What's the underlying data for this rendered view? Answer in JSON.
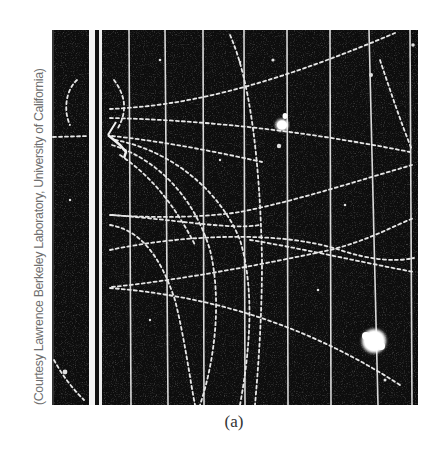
{
  "figure": {
    "label": "(a)",
    "credit": "(Courtesy Lawrence Berkeley Laboratory, University of California)",
    "image_subject": "bubble-chamber-particle-tracks",
    "colors": {
      "background": "#ffffff",
      "photo_dark": "#0d0d0d",
      "track": "#e8e8e8",
      "credit_text": "#6f6f6f",
      "caption_text": "#333333"
    }
  }
}
